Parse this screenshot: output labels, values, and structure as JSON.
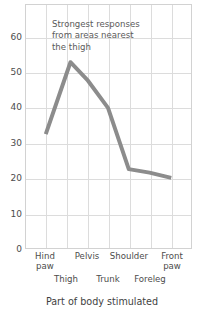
{
  "chart_data": {
    "type": "line",
    "title": "",
    "xlabel": "Part of body stimulated",
    "ylabel": "",
    "categories": [
      "Hind\npaw",
      "Thigh",
      "Pelvis",
      "Trunk",
      "Shoulder",
      "Foreleg",
      "Front\npaw"
    ],
    "category_labels_flat": [
      "Hind paw",
      "Thigh",
      "Pelvis",
      "Trunk",
      "Shoulder",
      "Foreleg",
      "Front paw"
    ],
    "values": [
      32.5,
      53,
      48,
      40,
      22.5,
      21.5,
      20
    ],
    "ylim": [
      0,
      67
    ],
    "yticks": [
      0,
      10,
      20,
      30,
      40,
      50,
      60
    ],
    "ytick_labels": [
      "0",
      "10",
      "20",
      "30",
      "40",
      "50",
      "60"
    ],
    "grid": true,
    "legend": false,
    "series": [
      {
        "name": "response",
        "values": [
          32.5,
          53,
          48,
          40,
          22.5,
          21.5,
          20
        ],
        "color": "#8c8c8c",
        "line_width": 4
      }
    ],
    "annotations": [
      {
        "text": "Strongest responses\nfrom areas nearest\nthe thigh",
        "x": "Pelvis",
        "y": 62
      }
    ],
    "colors": {
      "line": "#8c8c8c",
      "grid": "#dcdcdc",
      "frame": "#d2d2d2",
      "text": "#4c4c4c",
      "background": "#ffffff"
    }
  },
  "axis": {
    "x_title": "Part of body stimulated",
    "y_title_cropped": "]"
  },
  "yticks": {
    "t0": "0",
    "t10": "10",
    "t20": "20",
    "t30": "30",
    "t40": "40",
    "t50": "50",
    "t60": "60"
  },
  "xticks": {
    "hind_paw": "Hind\npaw",
    "thigh": "Thigh",
    "pelvis": "Pelvis",
    "trunk": "Trunk",
    "shoulder": "Shoulder",
    "foreleg": "Foreleg",
    "front_paw": "Front\npaw"
  },
  "annotation": {
    "text": "Strongest responses\nfrom areas nearest\nthe thigh"
  }
}
